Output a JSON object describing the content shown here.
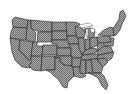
{
  "map": {
    "title": "United States (contiguous) state outline map",
    "fill_color": "#9a9a9a",
    "hatch_color": "#6a6a6a",
    "border_color": "#222222",
    "background": "#ffffff",
    "regions": [
      "WA",
      "OR",
      "CA",
      "ID",
      "NV",
      "MT",
      "WY",
      "UT",
      "AZ",
      "CO",
      "NM",
      "ND",
      "SD",
      "NE",
      "KS",
      "OK",
      "TX",
      "MN",
      "IA",
      "MO",
      "AR",
      "LA",
      "WI",
      "IL",
      "MI",
      "IN",
      "OH",
      "KY",
      "TN",
      "MS",
      "AL",
      "GA",
      "FL",
      "SC",
      "NC",
      "VA",
      "WV",
      "PA",
      "NY",
      "ME",
      "NE-states"
    ]
  }
}
